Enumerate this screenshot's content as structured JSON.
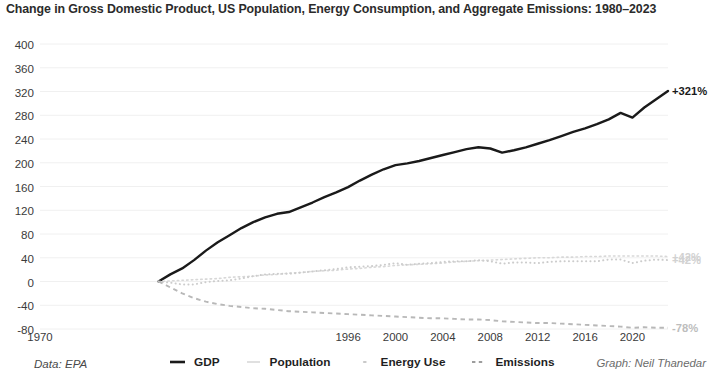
{
  "title": "Change in Gross Domestic Product, US Population, Energy Consumption, and Aggregate Emissions: 1980–2023",
  "footer": {
    "source": "Data: EPA",
    "credit": "Graph: Neil Thanedar"
  },
  "legend": [
    {
      "label": "GDP",
      "marker": "solid-line-icon",
      "color": "#1a1a1a"
    },
    {
      "label": "Population",
      "marker": "faint-dash-icon",
      "color": "#d8d8d8"
    },
    {
      "label": "Energy Use",
      "marker": "dotted-line-icon",
      "color": "#cccccc"
    },
    {
      "label": "Emissions",
      "marker": "dashed-line-icon",
      "color": "#b8b8b8"
    }
  ],
  "end_labels": {
    "gdp": "+321%",
    "population": "+42%",
    "energy": "+42%",
    "emissions": "-78%"
  },
  "chart_data": {
    "type": "line",
    "title": "Change in Gross Domestic Product, US Population, Energy Consumption, and Aggregate Emissions: 1980–2023",
    "xlabel": "",
    "ylabel": "",
    "grid": true,
    "legend_position": "bottom",
    "xlim": [
      1970,
      2023
    ],
    "ylim": [
      -80,
      400
    ],
    "yticks": [
      400,
      360,
      320,
      280,
      240,
      200,
      160,
      120,
      80,
      40,
      0,
      -40,
      -80
    ],
    "xticks": [
      1970,
      1996,
      2000,
      2004,
      2008,
      2012,
      2016,
      2020
    ],
    "xtick_labels": [
      "1970",
      "1996",
      "2000",
      "2004",
      "2008",
      "2012",
      "2016",
      "2020"
    ],
    "x": [
      1980,
      1981,
      1982,
      1983,
      1984,
      1985,
      1986,
      1987,
      1988,
      1989,
      1990,
      1991,
      1992,
      1993,
      1994,
      1995,
      1996,
      1997,
      1998,
      1999,
      2000,
      2001,
      2002,
      2003,
      2004,
      2005,
      2006,
      2007,
      2008,
      2009,
      2010,
      2011,
      2012,
      2013,
      2014,
      2015,
      2016,
      2017,
      2018,
      2019,
      2020,
      2021,
      2022,
      2023
    ],
    "series": [
      {
        "name": "GDP",
        "style": "solid",
        "color": "#1a1a1a",
        "end_label": "+321%",
        "values": [
          0,
          12,
          22,
          36,
          52,
          66,
          78,
          90,
          100,
          108,
          114,
          117,
          125,
          133,
          142,
          150,
          159,
          170,
          180,
          189,
          196,
          199,
          203,
          208,
          213,
          218,
          223,
          226,
          224,
          217,
          221,
          226,
          232,
          238,
          245,
          252,
          258,
          265,
          273,
          284,
          276,
          293,
          307,
          321
        ]
      },
      {
        "name": "Population",
        "style": "faint-dash",
        "color": "#d8d8d8",
        "end_label": "+42%",
        "values": [
          0,
          1,
          2,
          3,
          4,
          5,
          7,
          8,
          9,
          11,
          12,
          14,
          15,
          17,
          18,
          19,
          21,
          22,
          24,
          25,
          27,
          28,
          29,
          30,
          31,
          33,
          34,
          35,
          36,
          37,
          38,
          39,
          40,
          40,
          41,
          41,
          42,
          42,
          43,
          43,
          43,
          43,
          43,
          42
        ]
      },
      {
        "name": "Energy Use",
        "style": "dotted",
        "color": "#cccccc",
        "end_label": "+42%",
        "values": [
          0,
          -2,
          -5,
          -5,
          -1,
          1,
          2,
          5,
          9,
          12,
          13,
          13,
          15,
          17,
          19,
          21,
          24,
          25,
          26,
          28,
          31,
          28,
          30,
          31,
          33,
          34,
          34,
          36,
          34,
          30,
          32,
          32,
          31,
          33,
          34,
          34,
          34,
          34,
          37,
          37,
          31,
          35,
          37,
          36
        ]
      },
      {
        "name": "Emissions",
        "style": "dashed",
        "color": "#b8b8b8",
        "end_label": "-78%",
        "values": [
          0,
          -10,
          -20,
          -28,
          -34,
          -38,
          -41,
          -43,
          -45,
          -46,
          -48,
          -50,
          -51,
          -52,
          -53,
          -54,
          -55,
          -56,
          -57,
          -58,
          -59,
          -60,
          -61,
          -62,
          -62,
          -63,
          -64,
          -64,
          -65,
          -67,
          -68,
          -69,
          -70,
          -70,
          -71,
          -72,
          -73,
          -74,
          -75,
          -76,
          -78,
          -77,
          -78,
          -78
        ]
      }
    ]
  }
}
